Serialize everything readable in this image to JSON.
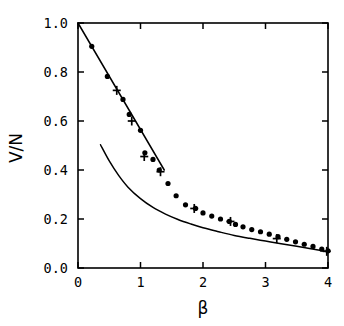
{
  "chart_data": {
    "type": "scatter",
    "title": "",
    "xlabel": "β",
    "ylabel": "V/N",
    "xlim": [
      0,
      4
    ],
    "ylim": [
      0,
      1
    ],
    "grid": false,
    "legend": "none",
    "xticks": [
      0,
      1,
      2,
      3,
      4
    ],
    "xtick_labels": [
      "0",
      "1",
      "2",
      "3",
      "4"
    ],
    "yticks": [
      0.0,
      0.2,
      0.4,
      0.6,
      0.8,
      1.0
    ],
    "ytick_labels": [
      "0.0",
      "0.2",
      "0.4",
      "0.6",
      "0.8",
      "1.0"
    ],
    "series": [
      {
        "name": "upper-straight-line",
        "type": "line",
        "marker": "none",
        "points": [
          [
            0.0,
            1.0
          ],
          [
            1.38,
            0.4
          ]
        ]
      },
      {
        "name": "lower-decay-curve",
        "type": "line",
        "marker": "none",
        "points": [
          [
            0.36,
            0.503
          ],
          [
            0.5,
            0.437
          ],
          [
            0.65,
            0.378
          ],
          [
            0.8,
            0.33
          ],
          [
            1.0,
            0.283
          ],
          [
            1.2,
            0.247
          ],
          [
            1.4,
            0.22
          ],
          [
            1.6,
            0.198
          ],
          [
            1.8,
            0.18
          ],
          [
            2.0,
            0.164
          ],
          [
            2.25,
            0.148
          ],
          [
            2.5,
            0.133
          ],
          [
            2.75,
            0.121
          ],
          [
            3.0,
            0.11
          ],
          [
            3.25,
            0.099
          ],
          [
            3.5,
            0.089
          ],
          [
            3.75,
            0.078
          ],
          [
            4.0,
            0.066
          ]
        ]
      },
      {
        "name": "circle-data",
        "type": "scatter",
        "marker": "filled-circle",
        "points": [
          [
            0.22,
            0.905
          ],
          [
            0.47,
            0.782
          ],
          [
            0.72,
            0.688
          ],
          [
            0.82,
            0.627
          ],
          [
            1.0,
            0.562
          ],
          [
            1.07,
            0.47
          ],
          [
            1.2,
            0.443
          ],
          [
            1.3,
            0.4
          ],
          [
            1.44,
            0.345
          ],
          [
            1.57,
            0.295
          ],
          [
            1.72,
            0.258
          ],
          [
            1.88,
            0.243
          ],
          [
            2.0,
            0.225
          ],
          [
            2.14,
            0.212
          ],
          [
            2.28,
            0.2
          ],
          [
            2.42,
            0.19
          ],
          [
            2.52,
            0.178
          ],
          [
            2.64,
            0.168
          ],
          [
            2.78,
            0.157
          ],
          [
            2.92,
            0.148
          ],
          [
            3.06,
            0.138
          ],
          [
            3.2,
            0.128
          ],
          [
            3.34,
            0.117
          ],
          [
            3.48,
            0.107
          ],
          [
            3.62,
            0.097
          ],
          [
            3.76,
            0.088
          ],
          [
            3.9,
            0.077
          ],
          [
            4.0,
            0.07
          ]
        ]
      },
      {
        "name": "plus-data",
        "type": "scatter",
        "marker": "plus",
        "points": [
          [
            0.62,
            0.725
          ],
          [
            0.86,
            0.6
          ],
          [
            1.06,
            0.455
          ],
          [
            1.32,
            0.393
          ],
          [
            1.86,
            0.243
          ],
          [
            2.44,
            0.19
          ],
          [
            3.18,
            0.12
          ],
          [
            3.98,
            0.068
          ]
        ]
      }
    ]
  }
}
